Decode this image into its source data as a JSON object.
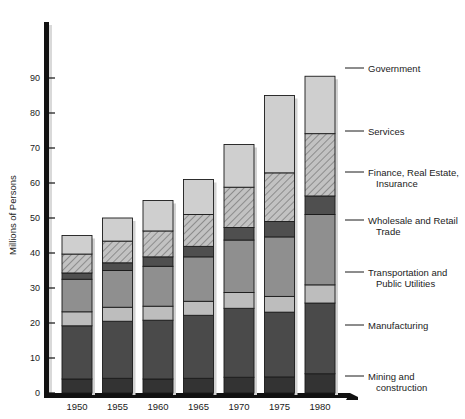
{
  "chart_data": {
    "type": "bar",
    "subtype": "stacked-bar",
    "title": "",
    "xlabel": "",
    "ylabel": "Millions of Persons",
    "categories": [
      "1950",
      "1955",
      "1960",
      "1965",
      "1970",
      "1975",
      "1980"
    ],
    "ylim": [
      0,
      95
    ],
    "yticks": [
      0,
      10,
      20,
      30,
      40,
      50,
      60,
      70,
      80,
      90
    ],
    "ytick_labels": [
      "0",
      "10",
      "20",
      "30",
      "40",
      "50",
      "60",
      "70",
      "80",
      "90"
    ],
    "grid": false,
    "legend_position": "right-callout",
    "stack_order_bottom_to_top": [
      "Mining and construction",
      "Manufacturing",
      "Transportation and Public Utilities",
      "Wholesale and Retail Trade",
      "Finance, Real Estate, Insurance",
      "Services",
      "Government"
    ],
    "series": [
      {
        "name": "Mining and construction",
        "fill": "#333333",
        "pattern": "solid",
        "values": [
          4.0,
          4.2,
          4.0,
          4.2,
          4.5,
          4.6,
          5.5
        ]
      },
      {
        "name": "Manufacturing",
        "fill": "#4a4a4a",
        "pattern": "solid",
        "values": [
          15.2,
          16.3,
          16.8,
          18.0,
          19.7,
          18.5,
          20.2
        ]
      },
      {
        "name": "Transportation and Public Utilities",
        "fill": "#bdbdbd",
        "pattern": "solid",
        "values": [
          4.0,
          4.0,
          4.0,
          4.0,
          4.5,
          4.5,
          5.2
        ]
      },
      {
        "name": "Wholesale and Retail Trade",
        "fill": "#8f8f8f",
        "pattern": "solid",
        "values": [
          9.3,
          10.5,
          11.4,
          12.7,
          15.0,
          17.0,
          20.1
        ]
      },
      {
        "name": "Finance, Real Estate, Insurance",
        "fill": "#4f4f4f",
        "pattern": "solid",
        "values": [
          1.8,
          2.2,
          2.7,
          3.0,
          3.6,
          4.4,
          5.3
        ]
      },
      {
        "name": "Services",
        "fill": "#adadad",
        "pattern": "diagonal-hatch",
        "values": [
          5.4,
          6.2,
          7.4,
          9.1,
          11.5,
          13.9,
          17.8
        ]
      },
      {
        "name": "Government",
        "fill": "#cfcfcf",
        "pattern": "solid",
        "values": [
          5.3,
          6.6,
          8.7,
          10.0,
          12.2,
          22.1,
          16.4
        ]
      }
    ],
    "totals": [
      45.0,
      50.0,
      55.0,
      61.0,
      71.0,
      85.0,
      90.5
    ]
  },
  "legend": {
    "items": [
      {
        "label": "Government",
        "label_line2": ""
      },
      {
        "label": "Services",
        "label_line2": ""
      },
      {
        "label": "Finance, Real Estate,",
        "label_line2": "Insurance"
      },
      {
        "label": "Wholesale and Retail",
        "label_line2": "Trade"
      },
      {
        "label": "Transportation and",
        "label_line2": "Public Utilities"
      },
      {
        "label": "Manufacturing",
        "label_line2": ""
      },
      {
        "label": "Mining and",
        "label_line2": "construction"
      }
    ]
  },
  "axis": {
    "y_title": "Millions of Persons"
  }
}
